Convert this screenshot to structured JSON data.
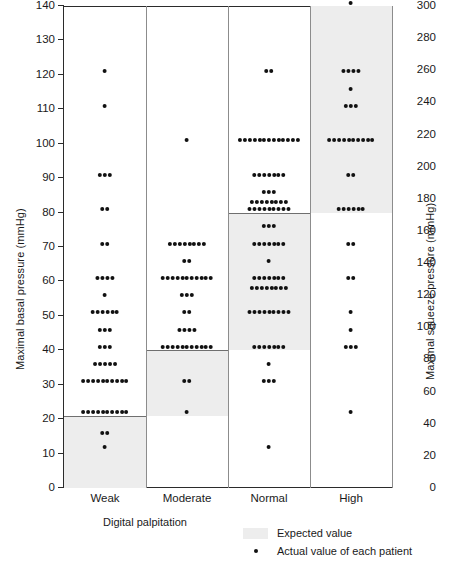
{
  "chart_data": {
    "type": "scatter",
    "subtype": "dot-strip-plot",
    "title": "",
    "xlabel": "Digital palpitation",
    "ylabel": "Maximal basal pressure (mmHg)",
    "ylabel_right": "Maximal squeeze pressure (mmHg)",
    "categories": [
      "Weak",
      "Moderate",
      "Normal",
      "High"
    ],
    "ylim": [
      0,
      140
    ],
    "yticks": [
      0,
      10,
      20,
      30,
      40,
      50,
      60,
      70,
      80,
      90,
      100,
      110,
      120,
      130,
      140
    ],
    "ylim_right": [
      0,
      300
    ],
    "yticks_right": [
      0,
      20,
      40,
      60,
      80,
      100,
      120,
      140,
      160,
      180,
      200,
      220,
      240,
      260,
      280,
      300
    ],
    "grid": false,
    "legend_position": "bottom-right",
    "expected_bands": [
      {
        "category": "Weak",
        "low": 0,
        "high": 21
      },
      {
        "category": "Moderate",
        "low": 21,
        "high": 40
      },
      {
        "category": "Normal",
        "low": 40,
        "high": 80
      },
      {
        "category": "High",
        "low": 80,
        "high": 140
      }
    ],
    "series": [
      {
        "name": "Weak",
        "points": [
          {
            "value": 121,
            "count": 1
          },
          {
            "value": 111,
            "count": 1
          },
          {
            "value": 91,
            "count": 3
          },
          {
            "value": 81,
            "count": 2
          },
          {
            "value": 71,
            "count": 2
          },
          {
            "value": 61,
            "count": 4
          },
          {
            "value": 56,
            "count": 1
          },
          {
            "value": 51,
            "count": 6
          },
          {
            "value": 46,
            "count": 3
          },
          {
            "value": 41,
            "count": 3
          },
          {
            "value": 36,
            "count": 5
          },
          {
            "value": 31,
            "count": 10
          },
          {
            "value": 22,
            "count": 10
          },
          {
            "value": 16,
            "count": 2
          },
          {
            "value": 12,
            "count": 1
          }
        ]
      },
      {
        "name": "Moderate",
        "points": [
          {
            "value": 101,
            "count": 1
          },
          {
            "value": 71,
            "count": 8
          },
          {
            "value": 66,
            "count": 2
          },
          {
            "value": 61,
            "count": 11
          },
          {
            "value": 56,
            "count": 3
          },
          {
            "value": 51,
            "count": 2
          },
          {
            "value": 46,
            "count": 4
          },
          {
            "value": 41,
            "count": 11
          },
          {
            "value": 31,
            "count": 2
          },
          {
            "value": 22,
            "count": 1
          }
        ]
      },
      {
        "name": "Normal",
        "points": [
          {
            "value": 121,
            "count": 2
          },
          {
            "value": 101,
            "count": 13
          },
          {
            "value": 91,
            "count": 7
          },
          {
            "value": 86,
            "count": 3
          },
          {
            "value": 83,
            "count": 8
          },
          {
            "value": 81,
            "count": 9
          },
          {
            "value": 76,
            "count": 3
          },
          {
            "value": 71,
            "count": 7
          },
          {
            "value": 66,
            "count": 1
          },
          {
            "value": 61,
            "count": 7
          },
          {
            "value": 58,
            "count": 8
          },
          {
            "value": 51,
            "count": 9
          },
          {
            "value": 41,
            "count": 7
          },
          {
            "value": 36,
            "count": 1
          },
          {
            "value": 31,
            "count": 3
          },
          {
            "value": 12,
            "count": 1
          }
        ]
      },
      {
        "name": "High",
        "points": [
          {
            "value": 141,
            "count": 1
          },
          {
            "value": 121,
            "count": 4
          },
          {
            "value": 116,
            "count": 1
          },
          {
            "value": 111,
            "count": 3
          },
          {
            "value": 101,
            "count": 10
          },
          {
            "value": 91,
            "count": 2
          },
          {
            "value": 81,
            "count": 6
          },
          {
            "value": 71,
            "count": 2
          },
          {
            "value": 61,
            "count": 2
          },
          {
            "value": 51,
            "count": 1
          },
          {
            "value": 46,
            "count": 1
          },
          {
            "value": 41,
            "count": 3
          },
          {
            "value": 22,
            "count": 1
          }
        ]
      }
    ],
    "legend": [
      {
        "key": "expected-value",
        "label": "Expected value",
        "marker": "shaded-band",
        "color": "#ededed"
      },
      {
        "key": "actual-value",
        "label": "Actual value of each patient",
        "marker": "dot",
        "color": "#111111"
      }
    ]
  }
}
